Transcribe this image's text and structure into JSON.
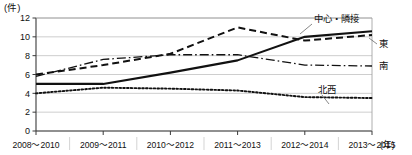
{
  "chart_data": {
    "type": "line",
    "title": "",
    "xlabel": "年",
    "ylabel": "件",
    "y_unit_label": "(件)",
    "x_unit_label": "(年)",
    "categories": [
      "2008〜2010",
      "2009〜2011",
      "2010〜2012",
      "2011〜2013",
      "2012〜2014",
      "2013〜2015"
    ],
    "ylim": [
      0,
      12
    ],
    "yticks": [
      0,
      2,
      4,
      6,
      8,
      10,
      12
    ],
    "ytick_labels": [
      "0",
      "2",
      "4",
      "6",
      "8",
      "10",
      "12"
    ],
    "grid": true,
    "legend_position": "inline-right-labels",
    "series": [
      {
        "name": "中心・隣接",
        "style": "solid",
        "values": [
          5.0,
          5.0,
          6.2,
          7.5,
          10.0,
          10.6
        ]
      },
      {
        "name": "東",
        "style": "dashed",
        "values": [
          6.0,
          7.0,
          8.2,
          11.0,
          9.6,
          10.2
        ]
      },
      {
        "name": "南",
        "style": "dash-dot",
        "values": [
          5.8,
          7.6,
          8.1,
          8.1,
          7.0,
          6.9
        ]
      },
      {
        "name": "北西",
        "style": "dotted",
        "values": [
          4.0,
          4.6,
          4.5,
          4.3,
          3.6,
          3.5
        ]
      }
    ]
  },
  "colors": {
    "line": "#111111",
    "grid": "#b9b9b9",
    "axis": "#3a3a3a",
    "background": "#ffffff"
  }
}
